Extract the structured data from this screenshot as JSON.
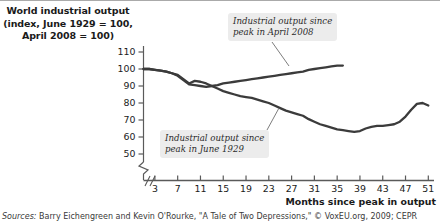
{
  "title": {
    "line1": "World industrial output",
    "line2": "(index, June 1929 = 100,",
    "line3": "April 2008 = 100)"
  },
  "callouts": {
    "depression_2008": {
      "line1": "Industrial output since",
      "line2": "peak in April 2008"
    },
    "depression_1929": {
      "line1": "Industrial output since",
      "line2": "peak in June 1929"
    }
  },
  "axis": {
    "x_title": "Months since peak in output",
    "y_ticks": [
      "110",
      "100",
      "90",
      "80",
      "70",
      "60",
      "50"
    ],
    "x_ticks": [
      "3",
      "7",
      "11",
      "15",
      "19",
      "23",
      "27",
      "31",
      "35",
      "39",
      "43",
      "47",
      "51"
    ]
  },
  "source": {
    "label": "Sources:",
    "text": " Barry Eichengreen and Kevin O'Rourke, \"A Tale of Two Depressions,\" © VoxEU.org, 2009; CEPR"
  },
  "colors": {
    "line": "#3b3b3b",
    "axis": "#5a5a5a",
    "callout_bg": "#ececec",
    "text": "#1a1a1a"
  },
  "chart_data": {
    "type": "line",
    "title": "World industrial output (index, June 1929 = 100, April 2008 = 100)",
    "xlabel": "Months since peak in output",
    "ylabel": "Index",
    "xlim": [
      1,
      52
    ],
    "ylim": [
      45,
      113
    ],
    "grid": false,
    "legend": "annotations",
    "y_axis_break_below": 50,
    "series": [
      {
        "name": "Industrial output since peak in June 1929",
        "x": [
          1,
          2,
          3,
          4,
          5,
          6,
          7,
          8,
          9,
          10,
          11,
          12,
          13,
          14,
          15,
          16,
          17,
          18,
          19,
          20,
          21,
          22,
          23,
          24,
          25,
          26,
          27,
          28,
          29,
          30,
          31,
          32,
          33,
          34,
          35,
          36,
          37,
          38,
          39,
          40,
          41,
          42,
          43,
          44,
          45,
          46,
          47,
          48,
          49,
          50,
          51
        ],
        "values": [
          100,
          100,
          99.5,
          99,
          98.5,
          97.5,
          96.5,
          94,
          91.5,
          93,
          92.5,
          91.5,
          90,
          88.5,
          87,
          86,
          85,
          84,
          83.5,
          83,
          82,
          81,
          80,
          78.5,
          77,
          75.5,
          74.5,
          73.5,
          72.5,
          70.5,
          69,
          67.5,
          66.5,
          65.5,
          64.5,
          64,
          63.5,
          63,
          63.5,
          65,
          66,
          66.5,
          66.5,
          67,
          67.5,
          69,
          72,
          76,
          79.5,
          80,
          78.5
        ]
      },
      {
        "name": "Industrial output since peak in April 2008",
        "x": [
          1,
          2,
          3,
          4,
          5,
          6,
          7,
          8,
          9,
          10,
          11,
          12,
          13,
          14,
          15,
          16,
          17,
          18,
          19,
          20,
          21,
          22,
          23,
          24,
          25,
          26,
          27,
          28,
          29,
          30,
          31,
          32,
          33,
          34,
          35,
          36
        ],
        "values": [
          100,
          100,
          99.5,
          99,
          98.5,
          97.5,
          96,
          93.5,
          91,
          90.5,
          90,
          89.5,
          90,
          90.5,
          91.5,
          92,
          92.5,
          93,
          93.5,
          94,
          94.5,
          95,
          95.5,
          96,
          96.5,
          97,
          97.5,
          98,
          98.5,
          99.5,
          100,
          100.5,
          101,
          101.5,
          102,
          102
        ]
      }
    ]
  }
}
